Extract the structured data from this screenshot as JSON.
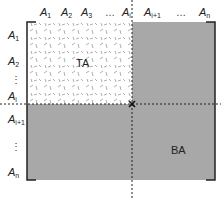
{
  "columns": {
    "labels": [
      {
        "base": "A",
        "sub": "1"
      },
      {
        "base": "A",
        "sub": "2"
      },
      {
        "base": "A",
        "sub": "3"
      },
      {
        "base": "…",
        "sub": ""
      },
      {
        "base": "A",
        "sub": "i"
      },
      {
        "base": "A",
        "sub": "i+1"
      },
      {
        "base": "…",
        "sub": ""
      },
      {
        "base": "A",
        "sub": "n"
      }
    ]
  },
  "rows": {
    "labels": [
      {
        "base": "A",
        "sub": "1"
      },
      {
        "base": "A",
        "sub": "2"
      },
      {
        "base": "⋮",
        "sub": ""
      },
      {
        "base": "A",
        "sub": "i"
      },
      {
        "base": "A",
        "sub": "i+1"
      },
      {
        "base": "⋮",
        "sub": ""
      },
      {
        "base": "A",
        "sub": "n"
      }
    ]
  },
  "regions": {
    "top_left": "TA",
    "bottom_right": "BA"
  },
  "colors": {
    "shaded": "#a8a8a8",
    "line": "#222222"
  }
}
